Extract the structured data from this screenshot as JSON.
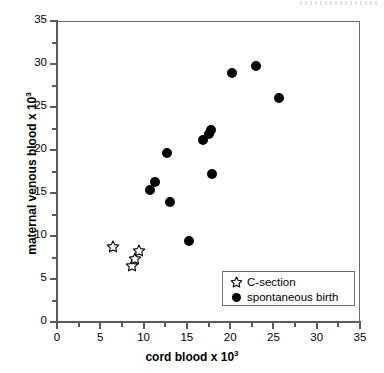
{
  "chart_data": {
    "type": "scatter",
    "title": "",
    "xlabel": "cord blood x 10",
    "xlabel_exponent": "3",
    "ylabel": "maternal venous blood  x 10",
    "ylabel_exponent": "3",
    "xlim": [
      0,
      35
    ],
    "ylim": [
      0,
      35
    ],
    "x_ticks": [
      0,
      5,
      10,
      15,
      20,
      25,
      30,
      35
    ],
    "y_ticks": [
      0,
      5,
      10,
      15,
      20,
      25,
      30,
      35
    ],
    "x_minor_ticks": [
      2.5,
      7.5,
      12.5,
      17.5,
      22.5,
      27.5,
      32.5
    ],
    "y_minor_ticks": [
      2.5,
      7.5,
      12.5,
      17.5,
      22.5,
      27.5,
      32.5
    ],
    "grid": false,
    "legend_position": "lower right",
    "series": [
      {
        "name": "C-section",
        "marker": "open-star",
        "color": "#000000",
        "points": [
          {
            "x": 6.5,
            "y": 8.7
          },
          {
            "x": 8.7,
            "y": 6.5
          },
          {
            "x": 9.0,
            "y": 7.3
          },
          {
            "x": 9.5,
            "y": 8.3
          }
        ]
      },
      {
        "name": "spontaneous birth",
        "marker": "filled-circle",
        "color": "#000000",
        "points": [
          {
            "x": 10.8,
            "y": 15.3
          },
          {
            "x": 11.3,
            "y": 16.3
          },
          {
            "x": 12.7,
            "y": 19.6
          },
          {
            "x": 13.1,
            "y": 13.9
          },
          {
            "x": 15.3,
            "y": 9.4
          },
          {
            "x": 16.9,
            "y": 21.2
          },
          {
            "x": 17.5,
            "y": 21.9
          },
          {
            "x": 17.8,
            "y": 22.3
          },
          {
            "x": 17.9,
            "y": 17.2
          },
          {
            "x": 20.2,
            "y": 29.0
          },
          {
            "x": 23.0,
            "y": 29.8
          },
          {
            "x": 25.6,
            "y": 26.1
          }
        ]
      }
    ]
  },
  "legend": {
    "entries": [
      {
        "label": "C-section",
        "marker": "open-star"
      },
      {
        "label": "spontaneous birth",
        "marker": "filled-circle"
      }
    ]
  }
}
